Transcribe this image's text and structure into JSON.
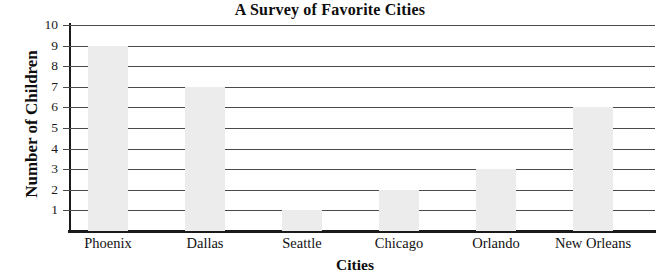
{
  "chart_data": {
    "type": "bar",
    "title": "A Survey of Favorite Cities",
    "xlabel": "Cities",
    "ylabel": "Number of Children",
    "categories": [
      "Phoenix",
      "Dallas",
      "Seattle",
      "Chicago",
      "Orlando",
      "New Orleans"
    ],
    "values": [
      9,
      7,
      1,
      2,
      3,
      6
    ],
    "ylim": [
      0,
      10
    ],
    "ytick_labels": [
      "1",
      "2",
      "3",
      "4",
      "5",
      "6",
      "7",
      "8",
      "9",
      "10"
    ],
    "ytick_values": [
      1,
      2,
      3,
      4,
      5,
      6,
      7,
      8,
      9,
      10
    ],
    "grid": true,
    "legend": false,
    "bar_color": "#ececec",
    "axis_color": "#1a1a1a",
    "gridline_color": "#4a4a4a",
    "text_color": "#111111",
    "background": "#ffffff"
  }
}
